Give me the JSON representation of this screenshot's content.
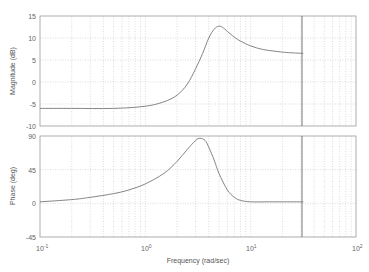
{
  "chart_data": [
    {
      "type": "line",
      "title": "",
      "xlabel": "",
      "ylabel": "Magnitude (dB)",
      "xscale": "log",
      "xlim": [
        0.1,
        100
      ],
      "ylim": [
        -10,
        15
      ],
      "yticks": [
        15,
        10,
        5,
        0,
        -5,
        -10
      ],
      "grid": true,
      "series": [
        {
          "name": "Magnitude",
          "x": [
            0.1,
            0.2,
            0.5,
            1.0,
            1.5,
            2.0,
            2.5,
            3.0,
            3.5,
            4.0,
            4.5,
            5.0,
            5.5,
            6.0,
            7.0,
            8.0,
            10.0,
            13.0,
            17.0,
            22.0,
            31.6
          ],
          "values": [
            -6.0,
            -6.0,
            -6.0,
            -5.5,
            -4.5,
            -3.0,
            -0.5,
            3.0,
            6.5,
            10.0,
            12.0,
            12.7,
            12.3,
            11.5,
            10.2,
            9.3,
            8.2,
            7.4,
            7.0,
            6.7,
            6.5
          ]
        }
      ],
      "annotations": [
        {
          "type": "vline",
          "x": 31.6
        }
      ]
    },
    {
      "type": "line",
      "title": "",
      "xlabel": "Frequency (rad/sec)",
      "ylabel": "Phase (deg)",
      "xscale": "log",
      "xlim": [
        0.1,
        100
      ],
      "ylim": [
        -45,
        90
      ],
      "yticks": [
        90,
        45,
        0,
        -45
      ],
      "xticks": [
        "10^-1",
        "10^0",
        "10^1",
        "10^2"
      ],
      "grid": true,
      "series": [
        {
          "name": "Phase",
          "x": [
            0.1,
            0.2,
            0.3,
            0.5,
            0.7,
            1.0,
            1.5,
            2.0,
            2.5,
            3.0,
            3.3,
            3.7,
            4.0,
            4.5,
            5.0,
            6.0,
            7.0,
            8.0,
            10.0,
            15.0,
            20.0,
            31.6
          ],
          "values": [
            2,
            5,
            8,
            13,
            18,
            26,
            40,
            56,
            72,
            84,
            87,
            84,
            75,
            58,
            40,
            18,
            8,
            4,
            2,
            2,
            2,
            2
          ]
        }
      ],
      "annotations": [
        {
          "type": "vline",
          "x": 31.6
        }
      ]
    }
  ],
  "labels": {
    "mag_ylabel": "Magnitude (dB)",
    "phase_ylabel": "Phase (deg)",
    "xlabel": "Frequency  (rad/sec)",
    "mag_ticks": [
      "15",
      "10",
      "5",
      "0",
      "-5",
      "-10"
    ],
    "phase_ticks": [
      "90",
      "45",
      "0",
      "-45"
    ],
    "x_base": "10",
    "x_exps": [
      "-1",
      "0",
      "1",
      "2"
    ]
  }
}
